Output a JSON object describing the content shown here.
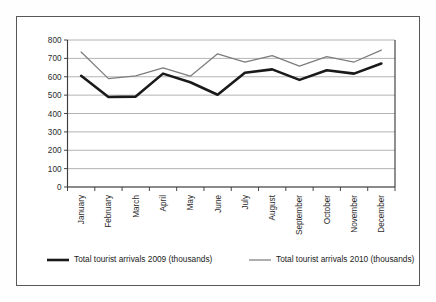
{
  "chart_data": {
    "type": "line",
    "title": "",
    "xlabel": "",
    "ylabel": "",
    "ylim": [
      0,
      800
    ],
    "ytick_step": 100,
    "yticks": [
      "0",
      "100",
      "200",
      "300",
      "400",
      "500",
      "600",
      "700",
      "800"
    ],
    "grid": true,
    "legend_position": "bottom",
    "categories": [
      "January",
      "February",
      "March",
      "April",
      "May",
      "June",
      "July",
      "August",
      "September",
      "October",
      "November",
      "December"
    ],
    "series": [
      {
        "name": "Total tourist arrivals 2009 (thousands)",
        "color": "#1a1a1a",
        "width": 2.6,
        "values": [
          605,
          490,
          492,
          617,
          570,
          502,
          622,
          640,
          583,
          635,
          617,
          672
        ]
      },
      {
        "name": "Total tourist arrivals 2010 (thousands)",
        "color": "#7d7d7f",
        "width": 1.25,
        "values": [
          735,
          590,
          605,
          648,
          603,
          725,
          680,
          715,
          658,
          710,
          680,
          745
        ]
      }
    ]
  },
  "legend": {
    "entries": [
      {
        "label": "Total tourist arrivals 2009 (thousands)"
      },
      {
        "label": "Total tourist arrivals 2010 (thousands)"
      }
    ]
  },
  "frame": {
    "border_color": "#58585a",
    "background": "#ffffff"
  }
}
